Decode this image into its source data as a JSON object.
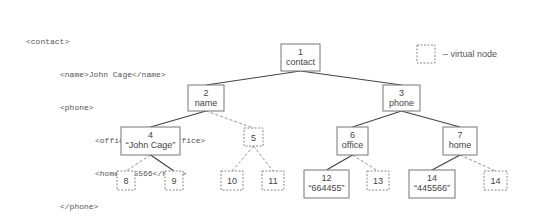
{
  "xml_source": {
    "lines": [
      {
        "indent": 0,
        "text": "<contact>"
      },
      {
        "indent": 1,
        "text": "<name>John Cage</name>"
      },
      {
        "indent": 1,
        "text": "<phone>"
      },
      {
        "indent": 2,
        "text": "<office>664455</office>"
      },
      {
        "indent": 2,
        "text": "<home>445566</home>"
      },
      {
        "indent": 1,
        "text": "</phone>"
      },
      {
        "indent": 0,
        "text": "</contact>"
      }
    ]
  },
  "legend": {
    "label": "– virtual node",
    "symbol": "dashed-box"
  },
  "tree": {
    "nodes": [
      {
        "id": "1",
        "lines": [
          "1",
          "contact"
        ],
        "virtual": false
      },
      {
        "id": "2",
        "lines": [
          "2",
          "name"
        ],
        "virtual": false
      },
      {
        "id": "3",
        "lines": [
          "3",
          "phone"
        ],
        "virtual": false
      },
      {
        "id": "4",
        "lines": [
          "4",
          "“John Cage”"
        ],
        "virtual": false
      },
      {
        "id": "5",
        "lines": [
          "5"
        ],
        "virtual": true
      },
      {
        "id": "6",
        "lines": [
          "6",
          "office"
        ],
        "virtual": false
      },
      {
        "id": "7",
        "lines": [
          "7",
          "home"
        ],
        "virtual": false
      },
      {
        "id": "8",
        "lines": [
          "8"
        ],
        "virtual": true
      },
      {
        "id": "9",
        "lines": [
          "9"
        ],
        "virtual": true
      },
      {
        "id": "10",
        "lines": [
          "10"
        ],
        "virtual": true
      },
      {
        "id": "11",
        "lines": [
          "11"
        ],
        "virtual": true
      },
      {
        "id": "12",
        "lines": [
          "12",
          "“664455”"
        ],
        "virtual": false
      },
      {
        "id": "13",
        "lines": [
          "13"
        ],
        "virtual": true
      },
      {
        "id": "14",
        "lines": [
          "14",
          "“445566”"
        ],
        "virtual": false
      },
      {
        "id": "14v",
        "lines": [
          "14"
        ],
        "virtual": true
      }
    ],
    "edges": [
      {
        "from": "1",
        "to": "2",
        "virtual": false
      },
      {
        "from": "1",
        "to": "3",
        "virtual": false
      },
      {
        "from": "2",
        "to": "4",
        "virtual": false
      },
      {
        "from": "2",
        "to": "5",
        "virtual": true
      },
      {
        "from": "3",
        "to": "6",
        "virtual": false
      },
      {
        "from": "3",
        "to": "7",
        "virtual": false
      },
      {
        "from": "4",
        "to": "8",
        "virtual": true
      },
      {
        "from": "4",
        "to": "9",
        "virtual": false
      },
      {
        "from": "5",
        "to": "10",
        "virtual": true
      },
      {
        "from": "5",
        "to": "11",
        "virtual": true
      },
      {
        "from": "6",
        "to": "12",
        "virtual": false
      },
      {
        "from": "6",
        "to": "13",
        "virtual": true
      },
      {
        "from": "7",
        "to": "14",
        "virtual": false
      },
      {
        "from": "7",
        "to": "14v",
        "virtual": true
      }
    ]
  }
}
